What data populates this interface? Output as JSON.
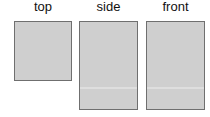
{
  "views": [
    {
      "label": "top",
      "fill": "#cfcfcf",
      "border": "#6f6f6f"
    },
    {
      "label": "side",
      "fill": "#cfcfcf",
      "border": "#6f6f6f"
    },
    {
      "label": "front",
      "fill": "#cfcfcf",
      "border": "#6f6f6f"
    }
  ]
}
